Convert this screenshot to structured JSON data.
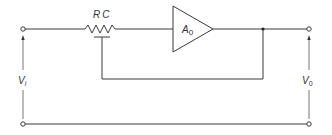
{
  "diagram": {
    "type": "circuit-schematic",
    "labels": {
      "resistor": "RC",
      "amplifier_main": "A",
      "amplifier_sub": "0",
      "input_main": "V",
      "input_sub": "i",
      "output_main": "V",
      "output_sub": "0"
    },
    "colors": {
      "line": "#3a3a3a",
      "background": "#ffffff"
    },
    "components": [
      {
        "id": "input-terminal-top",
        "kind": "terminal"
      },
      {
        "id": "input-terminal-bottom",
        "kind": "terminal"
      },
      {
        "id": "resistor-rc",
        "kind": "potentiometer",
        "label": "RC"
      },
      {
        "id": "amplifier",
        "kind": "amplifier",
        "label": "A0"
      },
      {
        "id": "junction",
        "kind": "node"
      },
      {
        "id": "output-terminal-top",
        "kind": "terminal"
      },
      {
        "id": "output-terminal-bottom",
        "kind": "terminal"
      }
    ]
  }
}
